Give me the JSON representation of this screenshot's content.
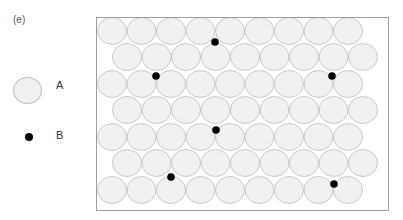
{
  "figure": {
    "panel_label": "(e)",
    "legend": [
      {
        "label": "A",
        "symbol": "large-light-circle"
      },
      {
        "label": "B",
        "symbol": "small-black-dot"
      }
    ],
    "lattice": {
      "rows": 7,
      "circles_per_row": 9,
      "circle_diameter_px": 30,
      "pattern": "hexagonal close-packed, alternate rows offset by half a circle",
      "circle_fill": "#f1f1f1",
      "circle_stroke": "#bdbdbd"
    },
    "interstitial_dots": [
      {
        "x": 215,
        "y": 42
      },
      {
        "x": 156,
        "y": 76
      },
      {
        "x": 332,
        "y": 76
      },
      {
        "x": 216,
        "y": 130
      },
      {
        "x": 171,
        "y": 177
      },
      {
        "x": 334,
        "y": 184
      }
    ],
    "dot_color": "#000000"
  }
}
